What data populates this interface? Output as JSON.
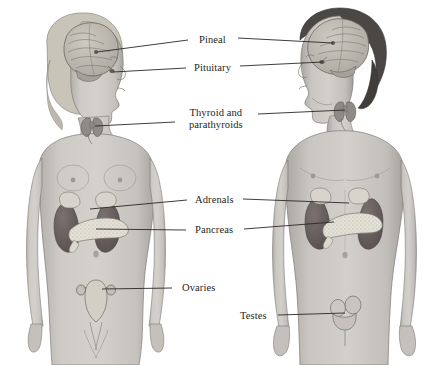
{
  "figure": {
    "background_color": "#ffffff",
    "width": 433,
    "height": 365
  },
  "palette": {
    "skin_light": "#cfcdc9",
    "skin_mid": "#bcb9b4",
    "skin_shadow": "#9d9a95",
    "outline": "#6e6b67",
    "hair_female": "#c9c4b8",
    "hair_male": "#4a4744",
    "brain": "#b9b5ad",
    "brain_line": "#6b6761",
    "kidney": "#6a6260",
    "kidney_dark": "#554e4c",
    "adrenal": "#d8d4cb",
    "pancreas": "#e0ddd4",
    "thyroid": "#8f8a84",
    "uterus": "#d3cfc7",
    "leader_line": "#2b2825",
    "label_text": "#231f1e"
  },
  "labels": [
    {
      "id": "pineal",
      "text": "Pineal",
      "x": 212,
      "y": 40,
      "align": "center",
      "lines": 1
    },
    {
      "id": "pituitary",
      "text": "Pituitary",
      "x": 212,
      "y": 68,
      "align": "center",
      "lines": 1
    },
    {
      "id": "thyroid",
      "text": "Thyroid and\nparathyroids",
      "x": 216,
      "y": 118,
      "align": "center",
      "lines": 2
    },
    {
      "id": "adrenals",
      "text": "Adrenals",
      "x": 214,
      "y": 200,
      "align": "center",
      "lines": 1
    },
    {
      "id": "pancreas",
      "text": "Pancreas",
      "x": 214,
      "y": 230,
      "align": "center",
      "lines": 1
    },
    {
      "id": "ovaries",
      "text": "Ovaries",
      "x": 198,
      "y": 288,
      "align": "center",
      "lines": 1
    },
    {
      "id": "testes",
      "text": "Testes",
      "x": 253,
      "y": 316,
      "align": "center",
      "lines": 1
    }
  ],
  "figures": [
    {
      "id": "female",
      "sex": "Female",
      "facing": "right",
      "hair": "light",
      "center_x": 95
    },
    {
      "id": "male",
      "sex": "Male",
      "facing": "left",
      "hair": "dark",
      "center_x": 345
    }
  ],
  "glands": [
    {
      "id": "pineal-female",
      "organ": "Pineal gland",
      "figure": "female",
      "x": 96,
      "y": 52
    },
    {
      "id": "pituitary-female",
      "organ": "Pituitary gland",
      "figure": "female",
      "x": 112,
      "y": 71
    },
    {
      "id": "thyroid-female",
      "organ": "Thyroid and parathyroids",
      "figure": "female",
      "x": 93,
      "y": 125
    },
    {
      "id": "adrenals-female",
      "organ": "Adrenal glands",
      "figure": "female",
      "x": 88,
      "y": 208
    },
    {
      "id": "pancreas-female",
      "organ": "Pancreas",
      "figure": "female",
      "x": 93,
      "y": 228
    },
    {
      "id": "ovaries-female",
      "organ": "Ovaries",
      "figure": "female",
      "x": 100,
      "y": 289
    },
    {
      "id": "pineal-male",
      "organ": "Pineal gland",
      "figure": "male",
      "x": 333,
      "y": 43
    },
    {
      "id": "pituitary-male",
      "organ": "Pituitary gland",
      "figure": "male",
      "x": 322,
      "y": 62
    },
    {
      "id": "thyroid-male",
      "organ": "Thyroid and parathyroids",
      "figure": "male",
      "x": 345,
      "y": 110
    },
    {
      "id": "adrenals-male",
      "organ": "Adrenal glands",
      "figure": "male",
      "x": 349,
      "y": 203
    },
    {
      "id": "pancreas-male",
      "organ": "Pancreas",
      "figure": "male",
      "x": 333,
      "y": 222
    },
    {
      "id": "testes-male",
      "organ": "Testes",
      "figure": "male",
      "x": 345,
      "y": 312
    }
  ],
  "leaders": [
    {
      "id": "pineal-left",
      "label": "pineal",
      "from": [
        188,
        40
      ],
      "to": [
        97,
        52
      ]
    },
    {
      "id": "pineal-right",
      "label": "pineal",
      "from": [
        238,
        38
      ],
      "to": [
        333,
        43
      ]
    },
    {
      "id": "pituitary-left",
      "label": "pituitary",
      "from": [
        186,
        68
      ],
      "to": [
        113,
        72
      ]
    },
    {
      "id": "pituitary-right",
      "label": "pituitary",
      "from": [
        240,
        66
      ],
      "to": [
        323,
        62
      ]
    },
    {
      "id": "thyroid-left",
      "label": "thyroid",
      "from": [
        175,
        122
      ],
      "to": [
        95,
        126
      ]
    },
    {
      "id": "thyroid-right",
      "label": "thyroid",
      "from": [
        258,
        114
      ],
      "to": [
        345,
        110
      ]
    },
    {
      "id": "adrenals-left",
      "label": "adrenals",
      "from": [
        187,
        200
      ],
      "to": [
        90,
        209
      ]
    },
    {
      "id": "adrenals-right",
      "label": "adrenals",
      "from": [
        243,
        199
      ],
      "to": [
        349,
        203
      ]
    },
    {
      "id": "pancreas-left",
      "label": "pancreas",
      "from": [
        186,
        230
      ],
      "to": [
        96,
        229
      ]
    },
    {
      "id": "pancreas-right",
      "label": "pancreas",
      "from": [
        244,
        229
      ],
      "to": [
        334,
        222
      ]
    },
    {
      "id": "ovaries-left",
      "label": "ovaries",
      "from": [
        172,
        288
      ],
      "to": [
        102,
        289
      ]
    },
    {
      "id": "testes-right",
      "label": "testes",
      "from": [
        278,
        315
      ],
      "to": [
        345,
        313
      ]
    }
  ]
}
